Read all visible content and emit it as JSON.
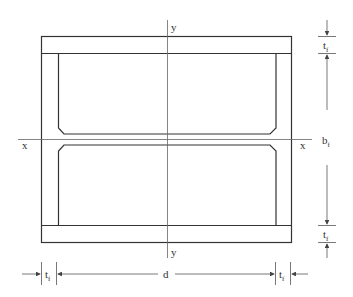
{
  "diagram": {
    "axes": {
      "x_left_label": "x",
      "x_right_label": "x",
      "y_top_label": "y",
      "y_bottom_label": "y"
    },
    "dimensions": {
      "top_flange_thickness": {
        "main": "t",
        "sub": "f"
      },
      "flange_width": {
        "main": "b",
        "sub": "f"
      },
      "bottom_flange_thickness": {
        "main": "t",
        "sub": "f"
      },
      "left_web_thickness": {
        "main": "t",
        "sub": "f"
      },
      "depth": {
        "main": "d"
      },
      "right_web_thickness": {
        "main": "t",
        "sub": "f"
      }
    },
    "colors": {
      "line": "#333333",
      "axis": "#555555",
      "dim": "#555555"
    }
  }
}
